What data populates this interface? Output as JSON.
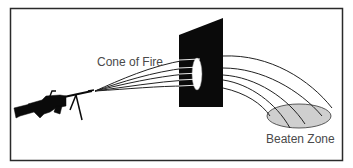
{
  "figure": {
    "labels": {
      "cone_of_fire": "Cone of Fire",
      "beaten_zone": "Beaten Zone"
    },
    "colors": {
      "frame": "#2a2a2a",
      "panel": "#0a0a0a",
      "trajectory": "#222222",
      "beaten_zone_fill": "#cfcfcf",
      "text": "#4a4a4a"
    },
    "icons": {
      "weapon": "machine-gun-silhouette",
      "target": "vertical-target-panel"
    }
  }
}
